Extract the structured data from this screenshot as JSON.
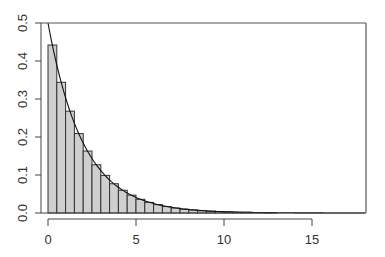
{
  "chart_data": {
    "type": "bar",
    "subtype": "histogram-with-density-curve",
    "title": "",
    "xlabel": "",
    "ylabel": "",
    "xlim": [
      0,
      18
    ],
    "ylim": [
      0,
      0.5
    ],
    "grid": false,
    "legend": null,
    "x_ticks": [
      0,
      5,
      10,
      15
    ],
    "x_tick_labels": [
      "0",
      "5",
      "10",
      "15"
    ],
    "y_ticks": [
      0.0,
      0.1,
      0.2,
      0.3,
      0.4,
      0.5
    ],
    "y_tick_labels": [
      "0.0",
      "0.1",
      "0.2",
      "0.3",
      "0.4",
      "0.5"
    ],
    "bin_width": 0.5,
    "bin_starts": [
      0,
      0.5,
      1,
      1.5,
      2,
      2.5,
      3,
      3.5,
      4,
      4.5,
      5,
      5.5,
      6,
      6.5,
      7,
      7.5,
      8,
      8.5,
      9,
      9.5,
      10,
      10.5,
      11,
      11.5,
      12,
      12.5
    ],
    "values": [
      0.442,
      0.344,
      0.268,
      0.209,
      0.163,
      0.127,
      0.099,
      0.077,
      0.06,
      0.047,
      0.036,
      0.028,
      0.022,
      0.017,
      0.013,
      0.01,
      0.008,
      0.006,
      0.005,
      0.004,
      0.003,
      0.002,
      0.002,
      0.001,
      0.001,
      0.001
    ],
    "series": [
      {
        "name": "histogram",
        "type": "bar",
        "color": "#cfcfcf"
      },
      {
        "name": "density",
        "type": "line",
        "formula": "0.5*exp(-0.5*x)",
        "x_range": [
          0,
          18
        ],
        "color": "#111111"
      }
    ]
  }
}
